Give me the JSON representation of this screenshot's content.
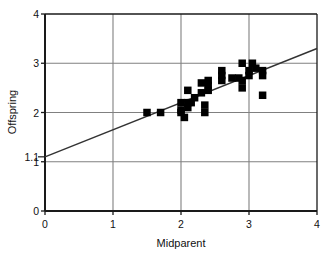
{
  "chart_data": {
    "type": "scatter",
    "title": "",
    "xlabel": "Midparent",
    "ylabel": "Offspring",
    "xlim": [
      0,
      4
    ],
    "ylim": [
      0,
      4
    ],
    "xticks": [
      0,
      1,
      2,
      3,
      4
    ],
    "yticks": [
      0,
      1,
      2,
      3,
      4
    ],
    "xtick_labels": [
      "0",
      "1",
      "2",
      "3",
      "4"
    ],
    "ytick_labels": [
      "0",
      "1",
      "2",
      "3",
      "4"
    ],
    "grid": true,
    "grid_color": "#808080",
    "axis_color": "#1a1a1a",
    "marker_color": "#000000",
    "marker_shape": "square",
    "extra_y_annotation": {
      "label": "1.1",
      "value": 1.1
    },
    "fit_line": {
      "name": "regression line",
      "color": "#333333",
      "intercept": 1.1,
      "slope": 0.55,
      "x_start": 0,
      "y_start": 1.1,
      "x_end": 4,
      "y_end": 3.3
    },
    "points": [
      [
        1.5,
        2.0
      ],
      [
        1.7,
        2.0
      ],
      [
        2.0,
        2.2
      ],
      [
        2.0,
        2.05
      ],
      [
        2.0,
        2.0
      ],
      [
        2.05,
        1.9
      ],
      [
        2.1,
        2.2
      ],
      [
        2.1,
        2.45
      ],
      [
        2.1,
        2.1
      ],
      [
        2.15,
        2.2
      ],
      [
        2.2,
        2.3
      ],
      [
        2.3,
        2.4
      ],
      [
        2.3,
        2.6
      ],
      [
        2.35,
        2.15
      ],
      [
        2.35,
        2.0
      ],
      [
        2.4,
        2.65
      ],
      [
        2.4,
        2.55
      ],
      [
        2.4,
        2.45
      ],
      [
        2.6,
        2.85
      ],
      [
        2.6,
        2.75
      ],
      [
        2.6,
        2.65
      ],
      [
        2.75,
        2.7
      ],
      [
        2.85,
        2.7
      ],
      [
        2.9,
        3.0
      ],
      [
        2.9,
        2.65
      ],
      [
        2.9,
        2.5
      ],
      [
        3.0,
        2.85
      ],
      [
        3.0,
        2.75
      ],
      [
        3.05,
        3.0
      ],
      [
        3.1,
        2.9
      ],
      [
        3.2,
        2.85
      ],
      [
        3.2,
        2.75
      ],
      [
        3.2,
        2.35
      ]
    ]
  }
}
